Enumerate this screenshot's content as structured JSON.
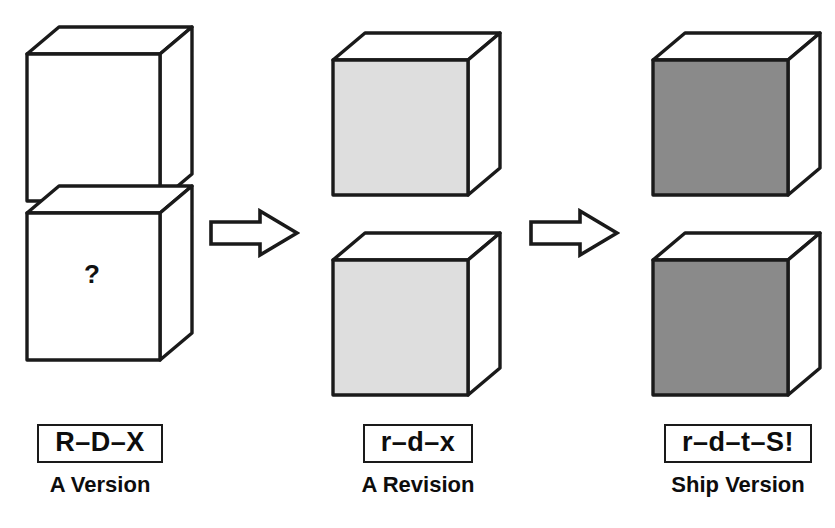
{
  "figure": {
    "title": "",
    "type": "process-flow-diagram",
    "background": "#ffffff",
    "ink_color": "#1a1a1a"
  },
  "palette": {
    "outline": "#1a1a1a",
    "face_white": "#ffffff",
    "face_light_gray": "#dedede",
    "face_dark_gray": "#8a8a8a",
    "top_face": "#ffffff",
    "side_face": "#ffffff"
  },
  "columns": [
    {
      "id": "column-a-version",
      "fill_name": "white",
      "front_fill": "#ffffff",
      "top_fill": "#ffffff",
      "side_fill": "#ffffff",
      "stacked": true,
      "marker": "?",
      "label": {
        "code": "R–D–X",
        "caption": "A Version"
      }
    },
    {
      "id": "column-a-revision",
      "fill_name": "light-gray",
      "front_fill": "#dedede",
      "top_fill": "#ffffff",
      "side_fill": "#ffffff",
      "stacked": false,
      "marker": "",
      "label": {
        "code": "r–d–x",
        "caption": "A Revision"
      }
    },
    {
      "id": "column-ship-version",
      "fill_name": "dark-gray",
      "front_fill": "#8a8a8a",
      "top_fill": "#ffffff",
      "side_fill": "#ffffff",
      "stacked": false,
      "marker": "",
      "label": {
        "code": "r–d–t–S!",
        "caption": "Ship Version"
      }
    }
  ],
  "arrows": [
    {
      "id": "arrow-1",
      "direction": "right",
      "style": "hollow-block"
    },
    {
      "id": "arrow-2",
      "direction": "right",
      "style": "hollow-block"
    }
  ]
}
